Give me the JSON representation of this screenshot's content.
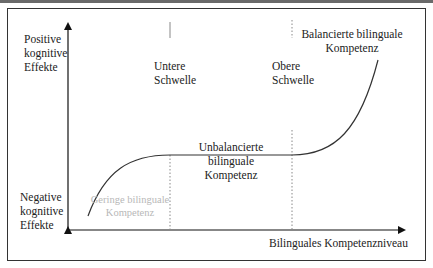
{
  "diagram": {
    "type": "threshold-hypothesis",
    "y_axis": {
      "top_label": [
        "Positive",
        "kognitive",
        "Effekte"
      ],
      "bottom_label": [
        "Negative",
        "kognitive",
        "Effekte"
      ]
    },
    "x_axis": {
      "label": "Bilinguales Kompetenzniveau"
    },
    "thresholds": [
      {
        "name": "lower",
        "label": [
          "Untere",
          "Schwelle"
        ]
      },
      {
        "name": "upper",
        "label": [
          "Obere",
          "Schwelle"
        ]
      }
    ],
    "regions": [
      {
        "name": "low",
        "label": [
          "Geringe bilinguale",
          "Kompetenz"
        ],
        "color": "#b8b8b8"
      },
      {
        "name": "unbalanced",
        "label": [
          "Unbalancierte bilinguale",
          "Kompetenz"
        ],
        "color": "#222222"
      },
      {
        "name": "balanced",
        "label": [
          "Balancierte bilinguale",
          "Kompetenz"
        ],
        "color": "#222222"
      }
    ],
    "colors": {
      "axis": "#111111",
      "curve": "#333333",
      "threshold_line": "#888888",
      "frame": "#333333"
    }
  }
}
